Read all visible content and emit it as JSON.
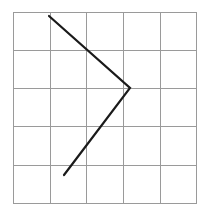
{
  "diagram": {
    "type": "grid-with-polyline",
    "grid": {
      "columns": 5,
      "rows": 5,
      "x_lines": [
        13,
        50,
        86,
        123,
        160,
        196
      ],
      "y_lines": [
        12,
        50,
        88,
        126,
        165,
        203
      ],
      "line_color": "#9a9a9a"
    },
    "polyline": {
      "points": [
        [
          49,
          16
        ],
        [
          130,
          88
        ],
        [
          64,
          175
        ]
      ],
      "color": "#1a1a1a",
      "width": 2.2
    }
  }
}
